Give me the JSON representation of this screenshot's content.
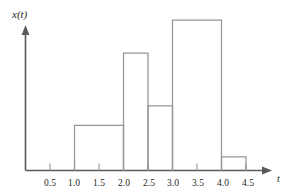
{
  "chart_data": {
    "type": "bar",
    "title": "",
    "subtitle": "",
    "xlabel": "t",
    "ylabel": "x(t)",
    "grid": false,
    "legend": "none",
    "xlim": [
      0,
      4.75
    ],
    "ylim": [
      0,
      1.12
    ],
    "xticks": [
      "0.5",
      "1.0",
      "1.5",
      "2.0",
      "2.5",
      "3.0",
      "3.5",
      "4.0",
      "4.5"
    ],
    "xtick_values": [
      0.5,
      1.0,
      1.5,
      2.0,
      2.5,
      3.0,
      3.5,
      4.0,
      4.5
    ],
    "yticks": [],
    "bin_edges": [
      1.0,
      2.0,
      2.5,
      3.0,
      4.0,
      4.5
    ],
    "categories": [
      "1.0-2.0",
      "2.0-2.5",
      "2.5-3.0",
      "3.0-4.0",
      "4.0-4.5"
    ],
    "values": [
      0.3,
      0.78,
      0.43,
      1.0,
      0.09
    ],
    "bars": [
      {
        "label": "1.0-2.0",
        "x_start": 1.0,
        "x_end": 2.0,
        "value": 0.3
      },
      {
        "label": "2.0-2.5",
        "x_start": 2.0,
        "x_end": 2.5,
        "value": 0.78
      },
      {
        "label": "2.5-3.0",
        "x_start": 2.5,
        "x_end": 3.0,
        "value": 0.43
      },
      {
        "label": "3.0-4.0",
        "x_start": 3.0,
        "x_end": 4.0,
        "value": 1.0
      },
      {
        "label": "4.0-4.5",
        "x_start": 4.0,
        "x_end": 4.5,
        "value": 0.09
      }
    ],
    "colors": {
      "axis": "#58595b",
      "bar_outline": "#939598",
      "bar_fill": "none",
      "text": "#231f20",
      "background": "#ffffff"
    }
  },
  "axis": {
    "y_title": "x(t)",
    "x_title": "t"
  },
  "ticks": {
    "x": [
      {
        "label": "0.5"
      },
      {
        "label": "1.0"
      },
      {
        "label": "1.5"
      },
      {
        "label": "2.0"
      },
      {
        "label": "2.5"
      },
      {
        "label": "3.0"
      },
      {
        "label": "3.5"
      },
      {
        "label": "4.0"
      },
      {
        "label": "4.5"
      }
    ]
  }
}
